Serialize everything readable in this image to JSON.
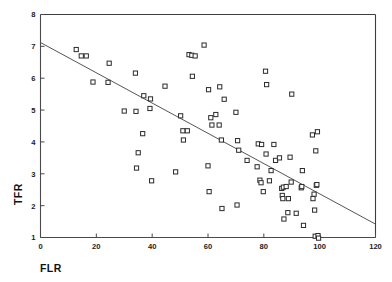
{
  "chart_data": {
    "type": "scatter",
    "title": "",
    "xlabel": "FLR",
    "ylabel": "TFR",
    "xlim": [
      0,
      120
    ],
    "ylim": [
      1,
      8
    ],
    "xticks": [
      0,
      20,
      40,
      60,
      80,
      100,
      120
    ],
    "xtick_labels": [
      "0",
      "20",
      "40",
      "60",
      "80",
      "100",
      "120"
    ],
    "yticks": [
      1,
      2,
      3,
      4,
      5,
      6,
      7,
      8
    ],
    "ytick_labels": [
      "1",
      "2",
      "3",
      "4",
      "5",
      "6",
      "7",
      "8"
    ],
    "grid": false,
    "legend": null,
    "marker": "open-square",
    "marker_color": "#2b2b2b",
    "line_color": "#555555",
    "trendline": {
      "type": "linear-fit",
      "x": [
        0,
        120
      ],
      "y": [
        7.12,
        1.42
      ]
    },
    "points": [
      {
        "x": 12.8,
        "y": 6.9
      },
      {
        "x": 14.6,
        "y": 6.7
      },
      {
        "x": 16.4,
        "y": 6.7
      },
      {
        "x": 18.8,
        "y": 5.88
      },
      {
        "x": 24.2,
        "y": 5.87
      },
      {
        "x": 24.6,
        "y": 6.47
      },
      {
        "x": 30.0,
        "y": 4.97
      },
      {
        "x": 34.0,
        "y": 6.16
      },
      {
        "x": 34.2,
        "y": 4.96
      },
      {
        "x": 34.4,
        "y": 3.18
      },
      {
        "x": 35.0,
        "y": 3.66
      },
      {
        "x": 36.6,
        "y": 4.26
      },
      {
        "x": 37.0,
        "y": 5.45
      },
      {
        "x": 39.2,
        "y": 5.05
      },
      {
        "x": 39.4,
        "y": 5.35
      },
      {
        "x": 39.8,
        "y": 2.78
      },
      {
        "x": 44.6,
        "y": 5.75
      },
      {
        "x": 48.4,
        "y": 3.06
      },
      {
        "x": 50.2,
        "y": 4.82
      },
      {
        "x": 51.0,
        "y": 4.35
      },
      {
        "x": 51.2,
        "y": 4.06
      },
      {
        "x": 52.6,
        "y": 4.35
      },
      {
        "x": 53.2,
        "y": 6.74
      },
      {
        "x": 54.2,
        "y": 6.72
      },
      {
        "x": 54.4,
        "y": 6.06
      },
      {
        "x": 55.4,
        "y": 6.7
      },
      {
        "x": 58.6,
        "y": 7.04
      },
      {
        "x": 60.0,
        "y": 3.25
      },
      {
        "x": 60.2,
        "y": 5.64
      },
      {
        "x": 60.4,
        "y": 2.44
      },
      {
        "x": 61.0,
        "y": 4.76
      },
      {
        "x": 61.4,
        "y": 4.53
      },
      {
        "x": 62.8,
        "y": 4.86
      },
      {
        "x": 64.0,
        "y": 4.53
      },
      {
        "x": 64.2,
        "y": 5.73
      },
      {
        "x": 64.8,
        "y": 4.06
      },
      {
        "x": 65.0,
        "y": 1.91
      },
      {
        "x": 65.8,
        "y": 5.34
      },
      {
        "x": 70.0,
        "y": 4.93
      },
      {
        "x": 70.4,
        "y": 2.02
      },
      {
        "x": 70.6,
        "y": 4.04
      },
      {
        "x": 71.0,
        "y": 3.74
      },
      {
        "x": 74.0,
        "y": 3.42
      },
      {
        "x": 77.6,
        "y": 3.22
      },
      {
        "x": 78.0,
        "y": 3.94
      },
      {
        "x": 78.6,
        "y": 2.8
      },
      {
        "x": 79.0,
        "y": 2.72
      },
      {
        "x": 79.2,
        "y": 3.92
      },
      {
        "x": 79.8,
        "y": 2.44
      },
      {
        "x": 80.6,
        "y": 6.22
      },
      {
        "x": 80.8,
        "y": 3.62
      },
      {
        "x": 81.0,
        "y": 5.8
      },
      {
        "x": 82.0,
        "y": 2.78
      },
      {
        "x": 82.6,
        "y": 3.1
      },
      {
        "x": 83.6,
        "y": 3.92
      },
      {
        "x": 84.2,
        "y": 3.42
      },
      {
        "x": 85.6,
        "y": 3.5
      },
      {
        "x": 86.4,
        "y": 2.54
      },
      {
        "x": 86.6,
        "y": 2.32
      },
      {
        "x": 86.8,
        "y": 2.22
      },
      {
        "x": 87.0,
        "y": 2.58
      },
      {
        "x": 87.2,
        "y": 1.58
      },
      {
        "x": 88.0,
        "y": 2.6
      },
      {
        "x": 88.6,
        "y": 1.78
      },
      {
        "x": 88.8,
        "y": 2.22
      },
      {
        "x": 89.4,
        "y": 3.52
      },
      {
        "x": 89.8,
        "y": 2.74
      },
      {
        "x": 90.0,
        "y": 5.5
      },
      {
        "x": 91.6,
        "y": 1.76
      },
      {
        "x": 93.4,
        "y": 2.56
      },
      {
        "x": 93.6,
        "y": 2.6
      },
      {
        "x": 93.8,
        "y": 3.1
      },
      {
        "x": 94.2,
        "y": 1.38
      },
      {
        "x": 97.4,
        "y": 4.22
      },
      {
        "x": 97.6,
        "y": 2.22
      },
      {
        "x": 98.0,
        "y": 2.36
      },
      {
        "x": 98.2,
        "y": 1.86
      },
      {
        "x": 98.4,
        "y": 1.04
      },
      {
        "x": 98.6,
        "y": 3.72
      },
      {
        "x": 98.8,
        "y": 2.64
      },
      {
        "x": 99.0,
        "y": 2.66
      },
      {
        "x": 99.2,
        "y": 4.32
      },
      {
        "x": 99.4,
        "y": 1.06
      },
      {
        "x": 99.6,
        "y": 0.98
      }
    ]
  }
}
